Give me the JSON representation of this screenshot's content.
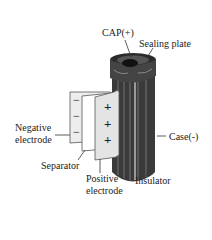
{
  "diagram": {
    "labels": {
      "cap": "CAP(+)",
      "sealing_plate": "Sealing plate",
      "negative_electrode_1": "Negative",
      "negative_electrode_2": "electrode",
      "case": "Case(-)",
      "separator": "Separator",
      "positive_electrode_1": "Positive",
      "positive_electrode_2": "electrode",
      "insulator": "Insulator"
    },
    "signs": {
      "negative": [
        "−",
        "−",
        "−"
      ],
      "positive": [
        "+",
        "+",
        "+"
      ]
    }
  }
}
